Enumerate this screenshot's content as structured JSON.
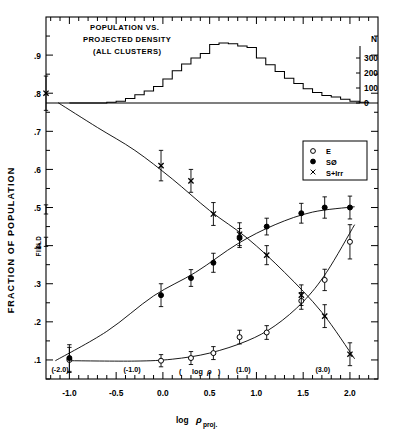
{
  "figure": {
    "histogram_title_line1": "POPULATION VS.",
    "histogram_title_line2": "PROJECTED DENSITY",
    "histogram_title_line3": "(ALL CLUSTERS)",
    "y_axis_label": "FRACTION OF POPULATION",
    "x_axis_label_main": "log",
    "x_axis_label_sym": "ρ",
    "x_axis_label_sub": "proj.",
    "field_label": "FIELD",
    "secondary_axis_label_open": "(",
    "secondary_axis_label_text": "log",
    "secondary_axis_label_sym": "ρ",
    "secondary_axis_label_close": ")",
    "n_axis_label": "N"
  },
  "legend": {
    "position": "upper-right",
    "items": [
      {
        "marker": "open-circle-icon",
        "label": "E"
      },
      {
        "marker": "filled-circle-icon",
        "label": "SØ"
      },
      {
        "marker": "cross-icon",
        "label": "S+Irr"
      }
    ]
  },
  "chart_data": {
    "type": "scatter",
    "title": "POPULATION VS. PROJECTED DENSITY (ALL CLUSTERS)",
    "xlabel": "log ρproj.",
    "ylabel": "FRACTION OF POPULATION",
    "xlim": [
      -1.25,
      2.3
    ],
    "ylim": [
      0.05,
      1.0
    ],
    "grid": false,
    "legend_position": "upper-right",
    "x_ticks": [
      "-1.0",
      "-0.5",
      "0.0",
      "0.5",
      "1.0",
      "1.5",
      "2.0"
    ],
    "x_tick_values": [
      -1.0,
      -0.5,
      0.0,
      0.5,
      1.0,
      1.5,
      2.0
    ],
    "y_ticks": [
      ".1",
      ".2",
      ".3",
      ".4",
      ".5",
      ".6",
      ".7",
      ".8",
      ".9"
    ],
    "y_tick_values": [
      0.1,
      0.2,
      0.3,
      0.4,
      0.5,
      0.6,
      0.7,
      0.8,
      0.9
    ],
    "secondary_x_ticks": [
      {
        "label": "(-2.0)",
        "x": -1.1
      },
      {
        "label": "(-1.0)",
        "x": -0.33
      },
      {
        "label": "(1.0)",
        "x": 0.86
      },
      {
        "label": "(3.0)",
        "x": 1.71
      }
    ],
    "n_axis": {
      "label": "N",
      "ticks": [
        0,
        100,
        200,
        300
      ],
      "tick_labels": [
        "0",
        "100",
        "200",
        "300"
      ],
      "range": [
        0,
        520
      ]
    },
    "field_points": [
      {
        "series": "S+Irr",
        "x": -1.22,
        "y": 0.8,
        "yerr": 0.045
      },
      {
        "series": "SØ",
        "x": -1.22,
        "y": 0.495,
        "yerr": 0.012
      },
      {
        "series": "E",
        "x": -1.22,
        "y": 0.41,
        "yerr": 0.012
      }
    ],
    "series": [
      {
        "name": "E",
        "marker": "open-circle",
        "color": "#000000",
        "points": [
          {
            "x": -1.0,
            "y": 0.1,
            "yerr": 0.033
          },
          {
            "x": -0.02,
            "y": 0.098,
            "yerr": 0.016
          },
          {
            "x": 0.3,
            "y": 0.105,
            "yerr": 0.017
          },
          {
            "x": 0.54,
            "y": 0.118,
            "yerr": 0.017
          },
          {
            "x": 0.82,
            "y": 0.16,
            "yerr": 0.018
          },
          {
            "x": 1.11,
            "y": 0.172,
            "yerr": 0.018
          },
          {
            "x": 1.48,
            "y": 0.255,
            "yerr": 0.022
          },
          {
            "x": 1.73,
            "y": 0.31,
            "yerr": 0.028
          },
          {
            "x": 2.0,
            "y": 0.41,
            "yerr": 0.045
          }
        ]
      },
      {
        "name": "SØ",
        "marker": "filled-circle",
        "color": "#000000",
        "points": [
          {
            "x": -1.0,
            "y": 0.105,
            "yerr": 0.035
          },
          {
            "x": -0.02,
            "y": 0.27,
            "yerr": 0.03
          },
          {
            "x": 0.3,
            "y": 0.315,
            "yerr": 0.022
          },
          {
            "x": 0.54,
            "y": 0.355,
            "yerr": 0.025
          },
          {
            "x": 0.82,
            "y": 0.42,
            "yerr": 0.025
          },
          {
            "x": 1.11,
            "y": 0.45,
            "yerr": 0.022
          },
          {
            "x": 1.48,
            "y": 0.485,
            "yerr": 0.026
          },
          {
            "x": 1.73,
            "y": 0.5,
            "yerr": 0.028
          },
          {
            "x": 2.0,
            "y": 0.5,
            "yerr": 0.03
          }
        ]
      },
      {
        "name": "S+Irr",
        "marker": "cross",
        "color": "#000000",
        "points": [
          {
            "x": -0.02,
            "y": 0.61,
            "yerr": 0.04
          },
          {
            "x": 0.3,
            "y": 0.57,
            "yerr": 0.03
          },
          {
            "x": 0.54,
            "y": 0.483,
            "yerr": 0.03
          },
          {
            "x": 0.82,
            "y": 0.43,
            "yerr": 0.03
          },
          {
            "x": 1.11,
            "y": 0.375,
            "yerr": 0.025
          },
          {
            "x": 1.48,
            "y": 0.27,
            "yerr": 0.027
          },
          {
            "x": 1.73,
            "y": 0.215,
            "yerr": 0.03
          },
          {
            "x": 2.0,
            "y": 0.115,
            "yerr": 0.03
          }
        ]
      }
    ],
    "histogram": {
      "name": "N",
      "bin_width": 0.1,
      "bins_x": [
        -0.95,
        -0.85,
        -0.75,
        -0.65,
        -0.55,
        -0.45,
        -0.35,
        -0.25,
        -0.15,
        -0.05,
        0.05,
        0.15,
        0.25,
        0.35,
        0.45,
        0.55,
        0.65,
        0.75,
        0.85,
        0.95,
        1.05,
        1.15,
        1.25,
        1.35,
        1.45,
        1.55,
        1.65,
        1.75,
        1.85,
        1.95,
        2.05,
        2.15
      ],
      "counts": [
        0,
        0,
        0,
        0,
        5,
        12,
        30,
        55,
        80,
        110,
        160,
        215,
        260,
        300,
        330,
        390,
        400,
        395,
        380,
        370,
        300,
        255,
        210,
        165,
        130,
        95,
        70,
        50,
        40,
        25,
        12,
        5
      ]
    }
  }
}
